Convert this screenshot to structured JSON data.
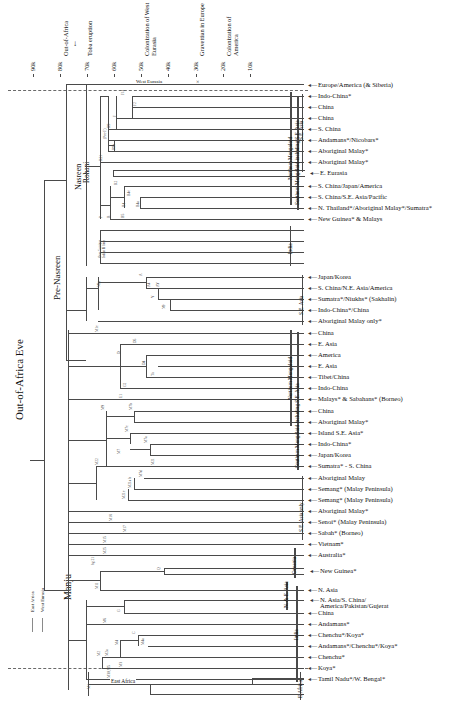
{
  "figure": {
    "type": "phylogenetic-tree",
    "orientation": "left-root-right-leaves",
    "root_label": "Out-of-Africa Eve"
  },
  "axis": {
    "unit_note": "k = thousand years before present",
    "ticks": [
      {
        "label": "90k",
        "x": 33
      },
      {
        "label": "80k",
        "x": 60
      },
      {
        "label": "70k",
        "x": 87
      },
      {
        "label": "60k",
        "x": 114
      },
      {
        "label": "50k",
        "x": 141
      },
      {
        "label": "40k",
        "x": 168
      },
      {
        "label": "30k",
        "x": 196
      },
      {
        "label": "20k",
        "x": 223
      },
      {
        "label": "10k",
        "x": 250
      }
    ],
    "events": [
      {
        "label": "Out-of-Africa",
        "x": 60
      },
      {
        "label": "Toba eruption",
        "x": 84
      },
      {
        "label": "Colonization of West Eurasia",
        "x": 141
      },
      {
        "label": "Gravettian in Europe",
        "x": 196
      },
      {
        "label": "Colonization of America",
        "x": 223
      }
    ]
  },
  "clades": [
    {
      "label": "Out-of-Africa Eve"
    },
    {
      "label": "Pre-Nasreen"
    },
    {
      "label": "Nasreen"
    },
    {
      "label": "Rohani"
    },
    {
      "label": "Manju"
    }
  ],
  "branch_annotations": {
    "west_eurasia": "West Eurasia",
    "east_africa": "East Africa",
    "x_mark": "×",
    "indian_r_note": "Over 5 unique\nIndian R lines"
  },
  "legend": {
    "items": [
      {
        "label": "East Africa",
        "color": "#8a8a8a"
      },
      {
        "label": "West Eurasia",
        "color": "#8a8a8a"
      }
    ]
  },
  "region_brackets": [
    {
      "label": "S.E. Asia",
      "top": 94,
      "bottom": 172
    },
    {
      "label": "Northern Mongoloid",
      "top": 92,
      "bottom": 205
    },
    {
      "label": "Southern Mongoloid including S.E. Asia",
      "top": 96,
      "bottom": 210
    },
    {
      "label": "India",
      "top": 222,
      "bottom": 262
    },
    {
      "label": "S.E. Asia",
      "top": 283,
      "bottom": 330
    },
    {
      "label": "Northern Mongoloid",
      "top": 330,
      "bottom": 425
    },
    {
      "label": "Southern Mongoloid including S.E. Asia",
      "top": 335,
      "bottom": 470
    },
    {
      "label": "S.E. Asia only",
      "top": 480,
      "bottom": 540
    },
    {
      "label": "Oceania",
      "top": 546,
      "bottom": 575
    },
    {
      "label": "N. & E. Asia",
      "top": 578,
      "bottom": 600
    },
    {
      "label": "India",
      "top": 600,
      "bottom": 660
    },
    {
      "label": "E.Africa",
      "top": 672,
      "bottom": 700
    }
  ],
  "leaves": [
    {
      "y": 85,
      "label": "Europe/America (& Siberia)",
      "x": 318
    },
    {
      "y": 96,
      "label": "Indo-China*",
      "x": 318
    },
    {
      "y": 107,
      "label": "China",
      "x": 318
    },
    {
      "y": 118,
      "label": "China",
      "x": 318
    },
    {
      "y": 129,
      "label": "S. China",
      "x": 318
    },
    {
      "y": 140,
      "label": "Andamans*/Nicobars*",
      "x": 318
    },
    {
      "y": 151,
      "label": "Aboriginal Malay*",
      "x": 318
    },
    {
      "y": 162,
      "label": "Aboriginal Malay*",
      "x": 318
    },
    {
      "y": 173,
      "label": "E. Eurasia",
      "x": 320
    },
    {
      "y": 186,
      "label": "S. China/Japan/America",
      "x": 318
    },
    {
      "y": 197,
      "label": "S. China/S.E. Asia/Pacific",
      "x": 318
    },
    {
      "y": 208,
      "label": "N. Thailand*/Aboriginal Malay*/Sumatra*",
      "x": 318
    },
    {
      "y": 219,
      "label": "New Guinea* & Malays",
      "x": 318
    },
    {
      "y": 277,
      "label": "Japan/Korea",
      "x": 318
    },
    {
      "y": 288,
      "label": "S. China/N.E. Asia/America",
      "x": 318
    },
    {
      "y": 299,
      "label": "Sumatra*/Niukhs* (Sakhalin)",
      "x": 318
    },
    {
      "y": 310,
      "label": "Indo-China*/China",
      "x": 318
    },
    {
      "y": 321,
      "label": "Aboriginal Malay only*",
      "x": 318
    },
    {
      "y": 333,
      "label": "China",
      "x": 318
    },
    {
      "y": 344,
      "label": "E. Asia",
      "x": 318
    },
    {
      "y": 355,
      "label": "America",
      "x": 318
    },
    {
      "y": 366,
      "label": "E. Asia",
      "x": 318
    },
    {
      "y": 377,
      "label": "Tibet/China",
      "x": 318
    },
    {
      "y": 388,
      "label": "Indo-China",
      "x": 318
    },
    {
      "y": 399,
      "label": "Malays* & Sabahans* (Borneo)",
      "x": 318
    },
    {
      "y": 411,
      "label": "China",
      "x": 318
    },
    {
      "y": 422,
      "label": "Aboriginal Malay*",
      "x": 318
    },
    {
      "y": 433,
      "label": "Island S.E. Asia*",
      "x": 318
    },
    {
      "y": 444,
      "label": "Indo-China*",
      "x": 318
    },
    {
      "y": 455,
      "label": "Japan/Korea",
      "x": 318
    },
    {
      "y": 466,
      "label": "Sumatra* - S. China",
      "x": 318
    },
    {
      "y": 478,
      "label": "Aboriginal Malay",
      "x": 318
    },
    {
      "y": 489,
      "label": "Semang* (Malay Peninsula)",
      "x": 318
    },
    {
      "y": 500,
      "label": "Semang* (Malay Peninsula)",
      "x": 318
    },
    {
      "y": 511,
      "label": "Aboriginal Malay*",
      "x": 318
    },
    {
      "y": 522,
      "label": "Senoi* (Malay Peninsula)",
      "x": 318
    },
    {
      "y": 533,
      "label": "Sabah* (Borneo)",
      "x": 318
    },
    {
      "y": 544,
      "label": "Vietnam*",
      "x": 318
    },
    {
      "y": 555,
      "label": "Australia*",
      "x": 318
    },
    {
      "y": 571,
      "label": "New Guinea*",
      "x": 320
    },
    {
      "y": 590,
      "label": "N. Asia",
      "x": 318
    },
    {
      "y": 600,
      "label": "N. Asia/S. China/",
      "x": 320
    },
    {
      "y": 606,
      "label": "America/Pakistan/Gujerat",
      "x": 320
    },
    {
      "y": 613,
      "label": "China",
      "x": 318
    },
    {
      "y": 624,
      "label": "Andamans*",
      "x": 318
    },
    {
      "y": 635,
      "label": "Chenchu*/Koya*",
      "x": 318
    },
    {
      "y": 646,
      "label": "Andamans*/Chenchu*/Koya*",
      "x": 318
    },
    {
      "y": 657,
      "label": "Chenchu*",
      "x": 318
    },
    {
      "y": 668,
      "label": "Koya*",
      "x": 318
    },
    {
      "y": 679,
      "label": "Tamil Nadu*/W. Bengal*",
      "x": 318
    }
  ],
  "node_labels": [
    {
      "id": "F1a",
      "x": 122,
      "y": 96
    },
    {
      "id": "F2",
      "x": 134,
      "y": 107
    },
    {
      "id": "F",
      "x": 114,
      "y": 118
    },
    {
      "id": "R9",
      "x": 108,
      "y": 129
    },
    {
      "id": "(Pre-F)",
      "x": 104,
      "y": 140
    },
    {
      "id": "R9b",
      "x": 113,
      "y": 151
    },
    {
      "id": "R21",
      "x": 100,
      "y": 162
    },
    {
      "id": "R2",
      "x": 115,
      "y": 186
    },
    {
      "id": "B4c",
      "x": 128,
      "y": 197
    },
    {
      "id": "B4a",
      "x": 137,
      "y": 208
    },
    {
      "id": "B4",
      "x": 123,
      "y": 208
    },
    {
      "id": "B5",
      "x": 122,
      "y": 219
    },
    {
      "id": "B",
      "x": 108,
      "y": 219
    },
    {
      "id": "P",
      "x": 100,
      "y": 219
    },
    {
      "id": "N9a",
      "x": 98,
      "y": 288
    },
    {
      "id": "A",
      "x": 140,
      "y": 277
    },
    {
      "id": "A4",
      "x": 148,
      "y": 288
    },
    {
      "id": "AY",
      "x": 157,
      "y": 288
    },
    {
      "id": "Y",
      "x": 152,
      "y": 299
    },
    {
      "id": "N9",
      "x": 163,
      "y": 310
    },
    {
      "id": "M1c",
      "x": 96,
      "y": 333
    },
    {
      "id": "D5",
      "x": 134,
      "y": 344
    },
    {
      "id": "D",
      "x": 118,
      "y": 355
    },
    {
      "id": "D4",
      "x": 143,
      "y": 366
    },
    {
      "id": "Tu",
      "x": 152,
      "y": 377
    },
    {
      "id": "G2",
      "x": 124,
      "y": 388
    },
    {
      "id": "E1",
      "x": 120,
      "y": 399
    },
    {
      "id": "M9",
      "x": 102,
      "y": 411
    },
    {
      "id": "M7b",
      "x": 130,
      "y": 411
    },
    {
      "id": "M7c",
      "x": 126,
      "y": 433
    },
    {
      "id": "M7a",
      "x": 145,
      "y": 444
    },
    {
      "id": "M7",
      "x": 118,
      "y": 455
    },
    {
      "id": "M21",
      "x": 152,
      "y": 466
    },
    {
      "id": "M22",
      "x": 96,
      "y": 466
    },
    {
      "id": "M7d",
      "x": 140,
      "y": 478
    },
    {
      "id": "M21a b",
      "x": 129,
      "y": 489
    },
    {
      "id": "M21c",
      "x": 123,
      "y": 500
    },
    {
      "id": "M18",
      "x": 110,
      "y": 522
    },
    {
      "id": "M17",
      "x": 124,
      "y": 533
    },
    {
      "id": "M15",
      "x": 104,
      "y": 544
    },
    {
      "id": "M25",
      "x": 104,
      "y": 555
    },
    {
      "id": "hg 21",
      "x": 92,
      "y": 566
    },
    {
      "id": "M11",
      "x": 96,
      "y": 590
    },
    {
      "id": "Q",
      "x": 158,
      "y": 571
    },
    {
      "id": "G",
      "x": 118,
      "y": 613
    },
    {
      "id": "M6",
      "x": 104,
      "y": 624
    },
    {
      "id": "C",
      "x": 133,
      "y": 635
    },
    {
      "id": "M4a",
      "x": 142,
      "y": 646
    },
    {
      "id": "M4",
      "x": 116,
      "y": 646
    },
    {
      "id": "M2a",
      "x": 106,
      "y": 657
    },
    {
      "id": "M2",
      "x": 98,
      "y": 657
    },
    {
      "id": "M3",
      "x": 120,
      "y": 668
    },
    {
      "id": "M30,M5",
      "x": 108,
      "y": 679
    },
    {
      "id": "M1",
      "x": 88,
      "y": 690
    }
  ]
}
